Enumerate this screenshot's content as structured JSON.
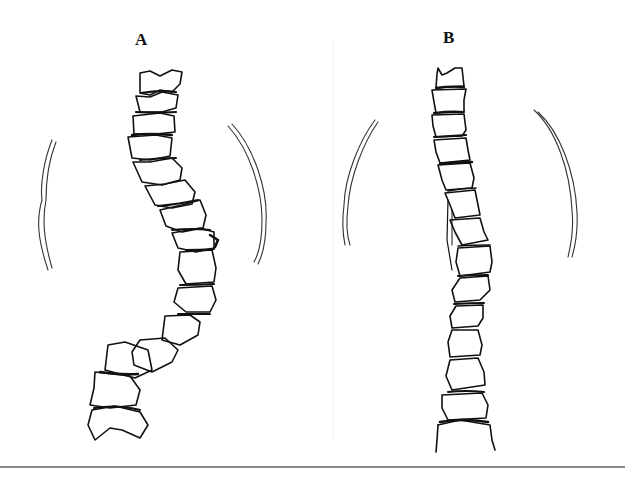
{
  "figure": {
    "panels": [
      {
        "label": "A",
        "description": "Scoliotic spine with lateral S-shaped curvature and asymmetric rib contours"
      },
      {
        "label": "B",
        "description": "Spine after correction, nearly straight, with symmetric rib contours"
      }
    ],
    "colors": {
      "line": "#111111",
      "rule": "#8a8a8a",
      "background": "#ffffff"
    }
  }
}
